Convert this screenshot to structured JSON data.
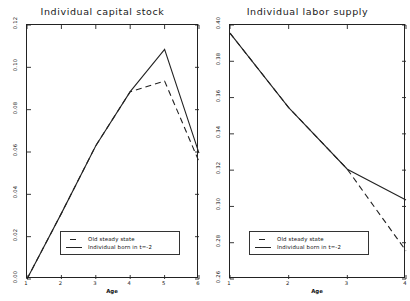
{
  "figure": {
    "background": "#ffffff",
    "line_color": "#222222"
  },
  "chart_data": [
    {
      "type": "line",
      "panel": "left",
      "title": "Individual capital stock",
      "xlabel": "Age",
      "ylabel": "",
      "xlim": [
        1,
        6
      ],
      "ylim": [
        0.0,
        0.12
      ],
      "xticks": [
        "1",
        "2",
        "3",
        "4",
        "5",
        "6"
      ],
      "xtick_values": [
        1,
        2,
        3,
        4,
        5,
        6
      ],
      "yticks": [
        "0.00",
        "0.02",
        "0.04",
        "0.06",
        "0.08",
        "0.10",
        "0.12"
      ],
      "ytick_values": [
        0.0,
        0.02,
        0.04,
        0.06,
        0.08,
        0.1,
        0.12
      ],
      "grid": false,
      "legend_position": "lower right",
      "series": [
        {
          "name": "Old steady state",
          "style": "dashed",
          "x": [
            1,
            2,
            3,
            4,
            5,
            6
          ],
          "values": [
            0.0,
            0.031,
            0.063,
            0.0885,
            0.0935,
            0.0555
          ]
        },
        {
          "name": "Individual born in t=-2",
          "style": "solid",
          "x": [
            1,
            2,
            3,
            4,
            5,
            6
          ],
          "values": [
            0.0,
            0.031,
            0.063,
            0.0885,
            0.1085,
            0.0595
          ]
        }
      ]
    },
    {
      "type": "line",
      "panel": "right",
      "title": "Individual labor supply",
      "xlabel": "Age",
      "ylabel": "",
      "xlim": [
        1,
        4
      ],
      "ylim": [
        0.26,
        0.4
      ],
      "xticks": [
        "1",
        "2",
        "3",
        "4"
      ],
      "xtick_values": [
        1,
        2,
        3,
        4
      ],
      "yticks": [
        "0.26",
        "0.28",
        "0.30",
        "0.32",
        "0.34",
        "0.36",
        "0.38",
        "0.40"
      ],
      "ytick_values": [
        0.26,
        0.28,
        0.3,
        0.32,
        0.34,
        0.36,
        0.38,
        0.4
      ],
      "grid": false,
      "legend_position": "lower left",
      "series": [
        {
          "name": "Old steady state",
          "style": "dashed",
          "x": [
            1,
            2,
            3,
            4
          ],
          "values": [
            0.3955,
            0.3545,
            0.3205,
            0.2755
          ]
        },
        {
          "name": "Individual born in t=-2",
          "style": "solid",
          "x": [
            1,
            2,
            3,
            4
          ],
          "values": [
            0.3955,
            0.3545,
            0.3205,
            0.3035
          ]
        }
      ]
    }
  ],
  "legend": {
    "entries": [
      {
        "label": "Old steady state",
        "style": "dashed"
      },
      {
        "label": "Individual born in t=-2",
        "style": "solid"
      }
    ]
  }
}
